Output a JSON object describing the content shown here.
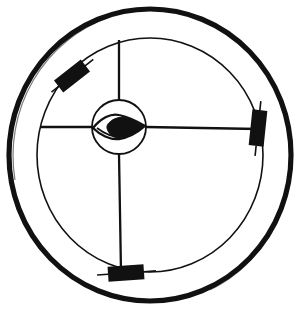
{
  "figure": {
    "background_color": "#ffffff",
    "ink_color": "#111111",
    "canvas": {
      "width": 304,
      "height": 317
    }
  },
  "outer_ring": {
    "label": "outer rim",
    "center_x": 150,
    "center_y": 155,
    "radius_x": 141,
    "radius_y": 146,
    "stroke_width": 5.2,
    "color": "#111111"
  },
  "inner_ring": {
    "label": "inner rim",
    "center_x": 150,
    "center_y": 155,
    "radius_x": 113,
    "radius_y": 117,
    "stroke_width": 1.6,
    "color": "#111111"
  },
  "hub": {
    "label": "hub circle",
    "center_x": 119,
    "center_y": 127,
    "radius": 27,
    "stroke_width": 1.8,
    "color": "#111111"
  },
  "eye": {
    "label": "eye symbol",
    "center_x": 119,
    "center_y": 127,
    "half_width": 26,
    "half_height": 11,
    "pupil_fill": "#111111",
    "stroke_width": 2.2
  },
  "spokes": [
    {
      "name": "spoke-up",
      "angle_deg": 270,
      "from_radius": 27,
      "to_radius": 117,
      "stroke_width": 2.2
    },
    {
      "name": "spoke-right",
      "angle_deg": 0,
      "from_radius": 27,
      "to_radius": 117,
      "stroke_width": 2.2
    },
    {
      "name": "spoke-down",
      "angle_deg": 90,
      "from_radius": 27,
      "to_radius": 148,
      "stroke_width": 2.2
    },
    {
      "name": "spoke-left",
      "angle_deg": 180,
      "from_radius": 27,
      "to_radius": 86,
      "stroke_width": 2.2
    }
  ],
  "blocks": [
    {
      "name": "block-upper-left",
      "center_x": 72,
      "center_y": 76,
      "width": 34,
      "height": 15,
      "rotation_deg": -38,
      "fill": "#111111",
      "lead_length": 13
    },
    {
      "name": "block-right",
      "center_x": 258,
      "center_y": 128,
      "width": 15,
      "height": 36,
      "rotation_deg": 6,
      "fill": "#111111",
      "lead_length": 8
    },
    {
      "name": "block-bottom",
      "center_x": 126,
      "center_y": 273,
      "width": 36,
      "height": 15,
      "rotation_deg": -4,
      "fill": "#111111",
      "lead_length": 10
    }
  ],
  "legend": {
    "shape_names": [
      "outer-ring-icon",
      "inner-ring-icon",
      "hub-icon",
      "eye-icon",
      "spoke-icon",
      "block-icon"
    ]
  },
  "chart_data": {
    "type": "diagram",
    "elements": [
      {
        "element": "outer ring",
        "count": 1,
        "radius": 141
      },
      {
        "element": "inner ring",
        "count": 1,
        "radius": 113
      },
      {
        "element": "hub circle",
        "count": 1,
        "radius": 27
      },
      {
        "element": "eye symbol",
        "count": 1
      },
      {
        "element": "spokes",
        "count": 4,
        "angles_deg": [
          270,
          0,
          90,
          180
        ]
      },
      {
        "element": "black blocks",
        "count": 3,
        "positions_deg": [
          225,
          0,
          95
        ]
      }
    ]
  }
}
